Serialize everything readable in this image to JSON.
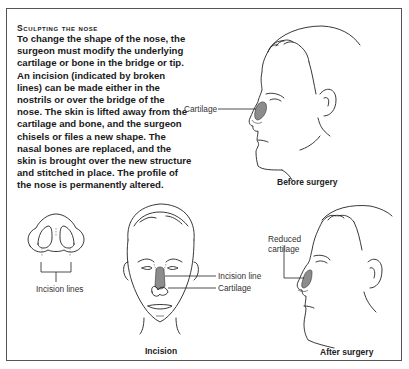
{
  "heading": "Sculpting the nose",
  "body": "To change the shape of the nose, the surgeon must modify the underlying cartilage or bone in the bridge or tip. An incision (indicated by broken lines) can be made either in the nostrils or over the bridge of the nose. The skin is lifted away from the cartilage and bone, and the surgeon chisels or files a new shape. The nasal bones are replaced, and the skin is brought over the new structure and stitched in place. The profile of the nose is permanently altered.",
  "panels": {
    "before": {
      "caption": "Before surgery",
      "labels": {
        "cartilage": "Cartilage"
      },
      "icon": "side-profile-face"
    },
    "nostril": {
      "labels": {
        "incision_lines": "Incision lines"
      },
      "icon": "nose-underside"
    },
    "incision": {
      "caption": "Incision",
      "labels": {
        "incision_line": "Incision line",
        "cartilage": "Cartilage"
      },
      "icon": "front-face"
    },
    "after": {
      "caption": "After surgery",
      "labels": {
        "reduced_cartilage_1": "Reduced",
        "reduced_cartilage_2": "cartilage"
      },
      "icon": "side-profile-face"
    }
  },
  "colors": {
    "cartilage_fill": "#8c8c8c",
    "frame": "#555555"
  }
}
